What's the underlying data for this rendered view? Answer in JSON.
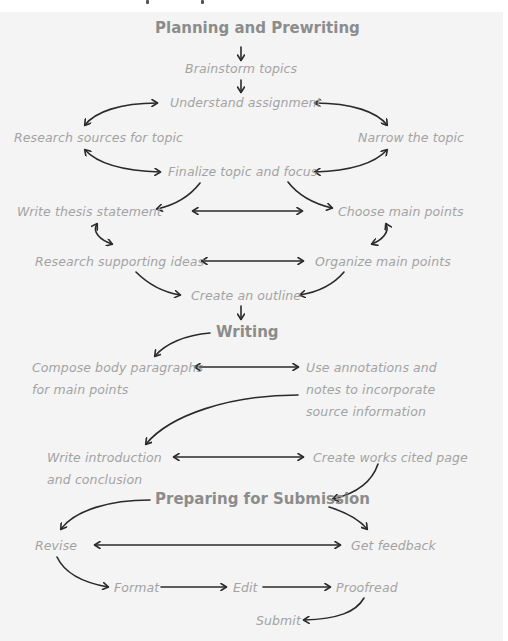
{
  "sections": {
    "planning": {
      "title": "Planning and Prewriting",
      "steps": {
        "brainstorm": "Brainstorm topics",
        "understand": "Understand assignment",
        "research_sources": "Research sources for topic",
        "narrow": "Narrow the topic",
        "finalize": "Finalize topic and focus",
        "thesis": "Write thesis statement",
        "choose_points": "Choose main points",
        "research_ideas": "Research supporting ideas",
        "organize": "Organize main points",
        "outline": "Create an outline"
      }
    },
    "writing": {
      "title": "Writing",
      "steps": {
        "compose_1": "Compose body paragraphs",
        "compose_2": "for main points",
        "annotations_1": "Use annotations and",
        "annotations_2": "notes to incorporate",
        "annotations_3": "source information",
        "intro_1": "Write introduction",
        "intro_2": "and conclusion",
        "works_cited": "Create works cited page"
      }
    },
    "submission": {
      "title": "Preparing for Submission",
      "steps": {
        "revise": "Revise",
        "feedback": "Get feedback",
        "format": "Format",
        "edit": "Edit",
        "proofread": "Proofread",
        "submit": "Submit"
      }
    }
  },
  "icons": {
    "arrow": "arrow-icon",
    "double_arrow": "double-arrow-icon"
  }
}
